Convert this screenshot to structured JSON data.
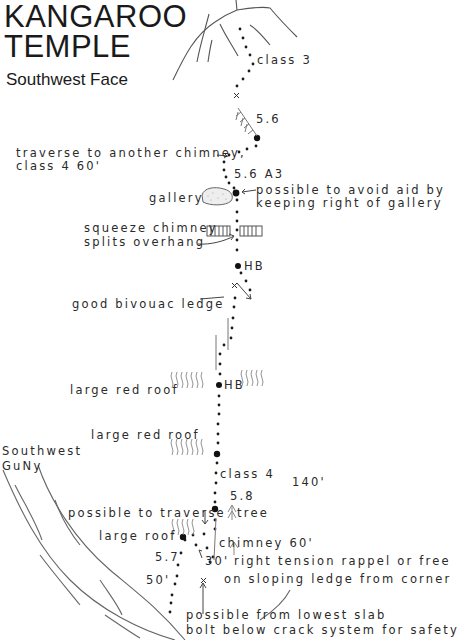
{
  "header": {
    "title_line1": "KANGAROO",
    "title_line2": "TEMPLE",
    "subtitle": "Southwest Face"
  },
  "labels": {
    "class3": "class 3",
    "grade_56_top": "5.6",
    "traverse_line1": "traverse to another chimney,",
    "traverse_line2": "class 4  60'",
    "grade_56_a3": "5.6  A3",
    "gallery": "gallery",
    "avoid_aid_line1": "possible to avoid aid by",
    "avoid_aid_line2": "keeping right of gallery",
    "squeeze_line1": "squeeze chimney",
    "squeeze_line2": "splits overhang",
    "hb_upper": "HB",
    "bivouac": "good bivouac ledge",
    "red_roof_1": "large red roof",
    "hb_lower": "HB",
    "red_roof_2": "large red roof",
    "gully_line1": "Southwest",
    "gully_line2": "GuNy",
    "class4": "class 4",
    "length_140": "140'",
    "grade_58": "5.8",
    "tree": "tree",
    "possible_traverse": "possible to traverse",
    "large_roof": "large roof",
    "chimney_60": "chimney 60'",
    "grade_57": "5.7",
    "length_30": "30'",
    "rappel_line1": "right tension rappel or free",
    "rappel_line2": "on sloping ledge from corner",
    "length_50": "50'",
    "lowest_slab_line1": "possible from lowest slab",
    "lowest_slab_line2": "bolt below crack system for safety"
  },
  "legend_symbols": {
    "belay": "large-dot",
    "route": "small-dots",
    "bolt": "x-mark",
    "tree": "tree-glyph",
    "roof": "squiggle-lines"
  }
}
